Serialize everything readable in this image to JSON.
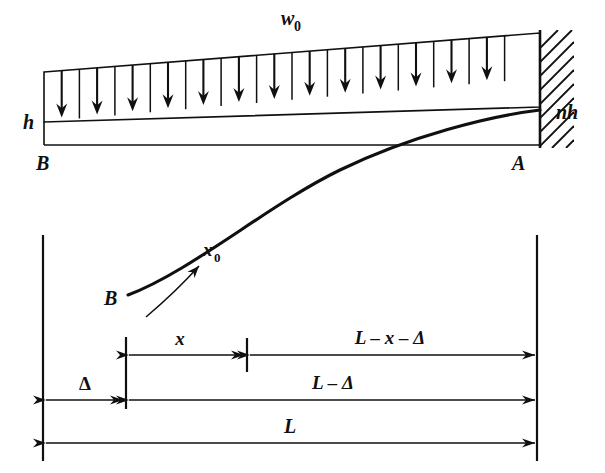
{
  "figure": {
    "title_alt": "Cantilever beam of linearly varying depth with uniformly distributed load",
    "ink_color": "#101010",
    "background": "#ffffff"
  },
  "beam": {
    "load_label": "w",
    "load_label_sub": "0",
    "left_depth_label": "h",
    "right_depth_label": "nh",
    "free_end_label": "B",
    "fixed_end_label": "A",
    "arrow_count": 13,
    "divider_count": 14
  },
  "deflection": {
    "curve_label": "x",
    "curve_label_sub": "0",
    "curve_start_label": "B"
  },
  "dimensions": [
    {
      "name": "x",
      "label": "x",
      "row": "top-left"
    },
    {
      "name": "L-x-delta",
      "label": "L – x – Δ",
      "row": "top-right"
    },
    {
      "name": "delta",
      "label": "Δ",
      "row": "middle-left"
    },
    {
      "name": "L-delta",
      "label": "L – Δ",
      "row": "middle-right"
    },
    {
      "name": "L",
      "label": "L",
      "row": "bottom"
    }
  ],
  "labels": {
    "w0_main": "w",
    "w0_sub": "0",
    "h": "h",
    "nh": "nh",
    "A": "A",
    "B_beam": "B",
    "B_curve": "B",
    "x0_main": "x",
    "x0_sub": "0",
    "dim_x": "x",
    "dim_L_x_delta": "L – x – Δ",
    "dim_delta": "Δ",
    "dim_L_delta": "L – Δ",
    "dim_L": "L"
  }
}
